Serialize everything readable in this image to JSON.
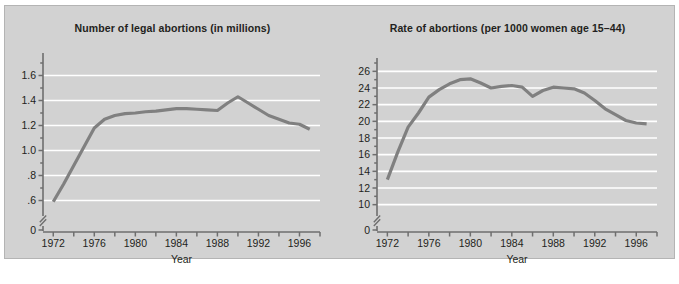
{
  "figure": {
    "background_color": "#d2d2d2",
    "border_color": "#b4b4b4",
    "series_color": "#808080",
    "gridline_color": "#ffffff",
    "axis_color": "#6e6e6e",
    "text_color": "#231f20"
  },
  "chart_data": [
    {
      "type": "line",
      "title": "Number of legal abortions (in millions)",
      "xlabel": "Year",
      "ylabel": "",
      "grid": true,
      "legend": "none",
      "xlim": [
        1971,
        1998
      ],
      "ylim": [
        0.5,
        1.7
      ],
      "yaxis_break": true,
      "y_tick_labels": [
        "1.6",
        "1.4",
        "1.2",
        "1.0",
        ".8",
        ".6",
        "0"
      ],
      "y_tick_values": [
        1.6,
        1.4,
        1.2,
        1.0,
        0.8,
        0.6,
        0
      ],
      "y_minor_tick_values": [
        1.7,
        1.5,
        1.3,
        1.1,
        0.9,
        0.7
      ],
      "x_tick_labels": [
        "1972",
        "1976",
        "1980",
        "1984",
        "1988",
        "1992",
        "1996"
      ],
      "x_tick_values": [
        1972,
        1976,
        1980,
        1984,
        1988,
        1992,
        1996
      ],
      "x_minor_tick_values": [
        1974,
        1978,
        1982,
        1986,
        1990,
        1994,
        1998
      ],
      "x": [
        1972,
        1973,
        1974,
        1975,
        1976,
        1977,
        1978,
        1979,
        1980,
        1981,
        1982,
        1983,
        1984,
        1985,
        1986,
        1987,
        1988,
        1989,
        1990,
        1991,
        1992,
        1993,
        1994,
        1995,
        1996,
        1997
      ],
      "values": [
        0.587,
        0.745,
        0.899,
        1.034,
        1.179,
        1.317,
        1.409,
        1.498,
        1.554,
        1.577,
        1.574,
        1.575,
        1.577,
        1.589,
        1.574,
        1.559,
        1.591,
        1.567,
        1.609,
        1.557,
        1.529,
        1.495,
        1.431,
        1.364,
        1.366,
        1.336
      ],
      "plotted_values": [
        0.59,
        0.73,
        0.88,
        1.03,
        1.18,
        1.25,
        1.28,
        1.295,
        1.3,
        1.31,
        1.315,
        1.325,
        1.335,
        1.335,
        1.33,
        1.325,
        1.32,
        1.38,
        1.43,
        1.38,
        1.33,
        1.28,
        1.25,
        1.22,
        1.21,
        1.17
      ],
      "annotations": []
    },
    {
      "type": "line",
      "title": "Rate of abortions (per 1000 women age 15–44)",
      "xlabel": "Year",
      "ylabel": "",
      "grid": true,
      "legend": "none",
      "xlim": [
        1971,
        1998
      ],
      "ylim": [
        9,
        27
      ],
      "yaxis_break": true,
      "y_tick_labels": [
        "26",
        "24",
        "22",
        "20",
        "18",
        "16",
        "14",
        "12",
        "10",
        "0"
      ],
      "y_tick_values": [
        26,
        24,
        22,
        20,
        18,
        16,
        14,
        12,
        10,
        0
      ],
      "y_minor_tick_values": [
        27,
        25,
        23,
        21,
        19,
        17,
        15,
        13,
        11
      ],
      "x_tick_labels": [
        "1972",
        "1976",
        "1980",
        "1984",
        "1988",
        "1992",
        "1996"
      ],
      "x_tick_values": [
        1972,
        1976,
        1980,
        1984,
        1988,
        1992,
        1996
      ],
      "x_minor_tick_values": [
        1974,
        1978,
        1982,
        1986,
        1990,
        1994,
        1998
      ],
      "x": [
        1972,
        1973,
        1974,
        1975,
        1976,
        1977,
        1978,
        1979,
        1980,
        1981,
        1982,
        1983,
        1984,
        1985,
        1986,
        1987,
        1988,
        1989,
        1990,
        1991,
        1992,
        1993,
        1994,
        1995,
        1996,
        1997
      ],
      "values": [
        13.0,
        16.3,
        19.3,
        21.0,
        22.9,
        23.8,
        24.5,
        25.0,
        25.1,
        24.6,
        24.0,
        24.2,
        24.3,
        24.1,
        23.0,
        23.7,
        24.1,
        24.0,
        23.9,
        23.4,
        22.5,
        21.5,
        20.8,
        20.1,
        19.8,
        19.7
      ],
      "plotted_values": [
        13.0,
        16.3,
        19.3,
        21.0,
        22.9,
        23.8,
        24.5,
        25.0,
        25.1,
        24.6,
        24.0,
        24.2,
        24.3,
        24.1,
        23.0,
        23.7,
        24.1,
        24.0,
        23.9,
        23.4,
        22.5,
        21.5,
        20.8,
        20.1,
        19.8,
        19.7
      ],
      "annotations": []
    }
  ]
}
